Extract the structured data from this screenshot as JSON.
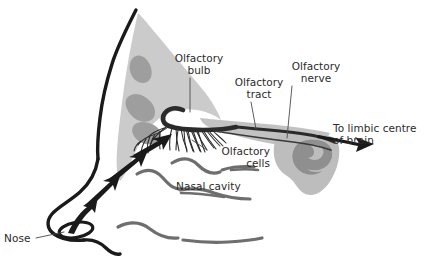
{
  "figure": {
    "background_color": "#ffffff",
    "text_color": "#2b2b2b",
    "ink_color": "#1a1a1a",
    "tissue_light_color": "#cccccc",
    "tissue_mid_color": "#b3b3b3",
    "tissue_dark_color": "#9a9a9a",
    "line_grey_color": "#6e6e6e"
  },
  "labels": {
    "olfactory_bulb": "Olfactory\nbulb",
    "olfactory_tract": "Olfactory\ntract",
    "olfactory_nerve": "Olfactory\nnerve",
    "to_limbic_centre": "To limbic centre\nof brain",
    "olfactory_cells": "Olfactory\ncells",
    "nasal_cavity": "Nasal cavity",
    "nose": "Nose"
  },
  "structures": [
    {
      "name": "nose-profile-outline",
      "label": "Nose"
    },
    {
      "name": "nasal-septum-tissue",
      "label": "Nasal septum tissue"
    },
    {
      "name": "olfactory-bulb",
      "label": "Olfactory bulb"
    },
    {
      "name": "olfactory-nerve-fibres",
      "label": "Olfactory cells"
    },
    {
      "name": "olfactory-tract",
      "label": "Olfactory tract"
    },
    {
      "name": "olfactory-nerve",
      "label": "Olfactory nerve"
    },
    {
      "name": "limbic-brain-region",
      "label": "To limbic centre of brain"
    },
    {
      "name": "nasal-cavity-turbinates",
      "label": "Nasal cavity"
    },
    {
      "name": "nostril",
      "label": "Nostril"
    },
    {
      "name": "airflow-arrows",
      "label": "Airflow"
    }
  ]
}
